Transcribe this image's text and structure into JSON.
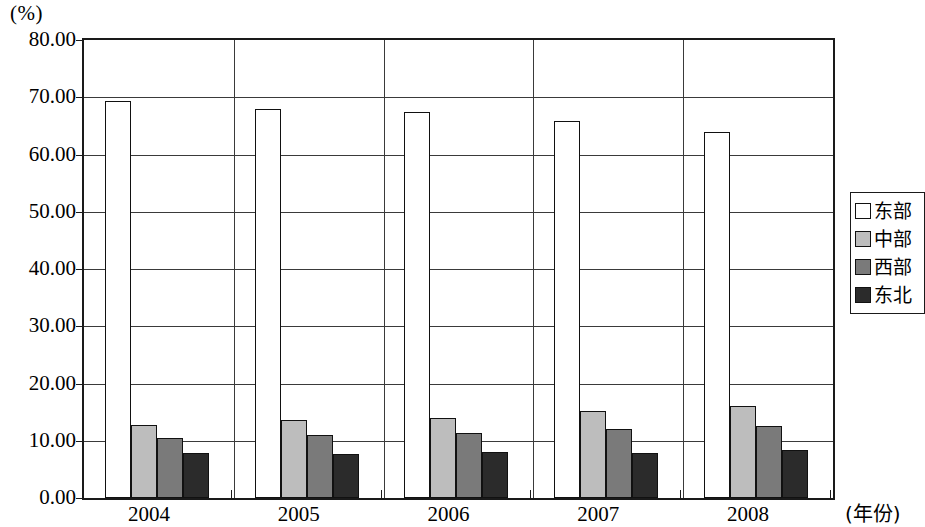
{
  "chart_data": {
    "type": "bar",
    "title": "",
    "subtitle": "",
    "xlabel": "(年份)",
    "ylabel": "(%)",
    "categories": [
      "2004",
      "2005",
      "2006",
      "2007",
      "2008"
    ],
    "series": [
      {
        "name": "东部",
        "color": "#ffffff",
        "values": [
          69.3,
          68.0,
          67.4,
          65.8,
          64.0
        ]
      },
      {
        "name": "中部",
        "color": "#bdbdbd",
        "values": [
          12.8,
          13.6,
          14.0,
          15.2,
          16.0
        ]
      },
      {
        "name": "西部",
        "color": "#7a7a7a",
        "values": [
          10.5,
          11.0,
          11.4,
          12.0,
          12.5
        ]
      },
      {
        "name": "东北",
        "color": "#2b2b2b",
        "values": [
          7.8,
          7.7,
          8.0,
          7.8,
          8.3
        ]
      }
    ],
    "ylim": [
      0,
      80
    ],
    "ytick_step": 10,
    "ytick_labels": [
      "0.00",
      "10.00",
      "20.00",
      "30.00",
      "40.00",
      "50.00",
      "60.00",
      "70.00",
      "80.00"
    ],
    "grid": true,
    "legend_position": "right"
  }
}
